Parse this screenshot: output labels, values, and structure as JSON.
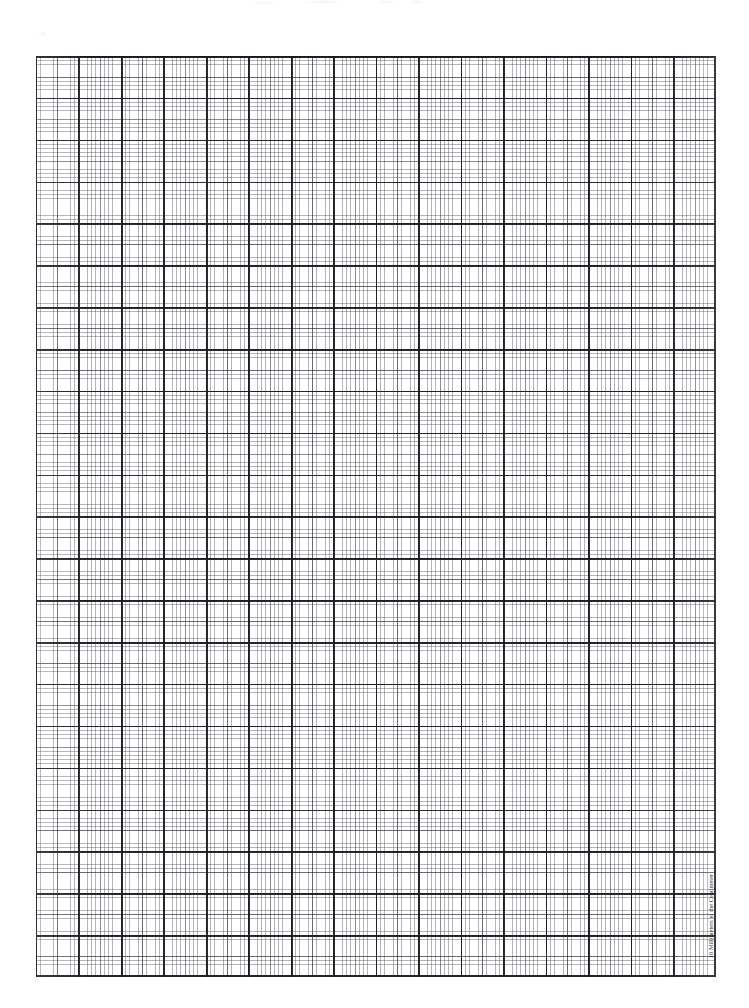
{
  "page": {
    "background_color": "#ffffff",
    "width_px": 749,
    "height_px": 1008
  },
  "grid": {
    "name": "metric-graph-paper-grid",
    "origin_x_px": 36,
    "origin_y_px": 56,
    "width_px": 680,
    "height_px": 921,
    "major_cell_px": 41.6,
    "minor_divisions_per_major": 10,
    "midline_every_n_minor": 5,
    "major_columns": 16,
    "major_rows": 22,
    "major_line_color": "#191920",
    "midline_color": "#2d2d37",
    "minor_line_color": "#3c3c46",
    "border_color": "#191920"
  },
  "caption": {
    "text": "10 Millimeters to the Centimeter",
    "rotation_deg": -90,
    "color": "#2a2a2f"
  },
  "artifacts": {
    "top_smudge_label": "scan smudge",
    "left_smudge_label": "scan smudge"
  }
}
